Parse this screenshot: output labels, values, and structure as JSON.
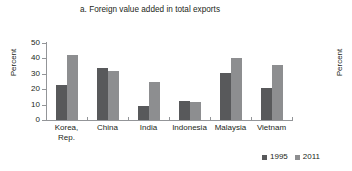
{
  "chart_data": {
    "type": "bar",
    "title": "a. Foreign value added in total exports",
    "xlabel": "",
    "ylabel": "Percent",
    "ylim": [
      0,
      50
    ],
    "yticks": [
      50,
      40,
      30,
      20,
      10,
      0
    ],
    "grid": false,
    "legend_position": "bottom-right",
    "categories": [
      "Korea,\nRep.",
      "China",
      "India",
      "Indonesia",
      "Malaysia",
      "Vietnam"
    ],
    "series": [
      {
        "name": "1995",
        "color": "#58595b",
        "values": [
          22.5,
          33.5,
          9.0,
          12.5,
          30.5,
          21.0
        ]
      },
      {
        "name": "2011",
        "color": "#8d8e90",
        "values": [
          42.0,
          32.0,
          24.5,
          11.5,
          40.5,
          36.0
        ]
      }
    ]
  },
  "adjacent_chart": {
    "ylabel": "Percent"
  }
}
